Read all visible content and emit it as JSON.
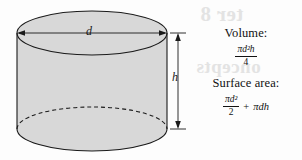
{
  "figure": {
    "name": "cylinder-volume-surface-area-figure",
    "shape": "cylinder",
    "background_color": "#fdfdfd",
    "ink_color": "#1a1a1a",
    "fill_color": "#d8d8d8"
  },
  "diagram": {
    "diameter_label": "d",
    "height_label": "h",
    "top_ellipse": {
      "cx": 92,
      "cy": 33,
      "rx": 75,
      "ry": 22
    },
    "bottom_ellipse": {
      "cx": 92,
      "cy": 129,
      "rx": 75,
      "ry": 22
    },
    "dimension_line_x": 178,
    "diameter_arrow_y": 33
  },
  "formulas": {
    "volume": {
      "heading": "Volume:",
      "numerator": "πd²h",
      "denominator": "4",
      "plain": "πd²h / 4"
    },
    "surface_area": {
      "heading": "Surface area:",
      "numerator": "πd²",
      "denominator": "2",
      "operator": "+",
      "second_term": "πdh",
      "plain": "πd²/2 + πdh"
    },
    "symbols": {
      "pi": "π",
      "d": "d",
      "h": "h",
      "exponent_two": "2"
    }
  },
  "bleed_through": {
    "title": "ter 8",
    "subtitle": "oncepts",
    "color": "#cfcfcf"
  }
}
